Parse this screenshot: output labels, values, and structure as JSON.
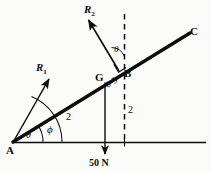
{
  "figure": {
    "background_color": "#fbfbfa",
    "ink_color": "#0d0d0d"
  },
  "points": {
    "a": {
      "label": "A",
      "x": 6,
      "y": 145
    },
    "b": {
      "label": "B",
      "x": 124,
      "y": 68
    },
    "c": {
      "label": "C",
      "x": 190,
      "y": 26
    },
    "g": {
      "label": "G",
      "x": 95,
      "y": 72
    }
  },
  "vectors": {
    "r1": {
      "label": "R",
      "subscript": "1",
      "x": 36,
      "y": 62
    },
    "r2": {
      "label": "R",
      "subscript": "2",
      "x": 84,
      "y": 4
    }
  },
  "angles": {
    "theta_at_a": {
      "label": "θ",
      "x": 26,
      "y": 130
    },
    "phi_at_a": {
      "label": "ϕ",
      "x": 47,
      "y": 124
    },
    "theta_at_b": {
      "label": "θ",
      "x": 114,
      "y": 45
    }
  },
  "dimensions": {
    "ag": {
      "label": "2",
      "x": 66,
      "y": 112
    },
    "gb": {
      "label": "0·5",
      "x": 104,
      "y": 82
    },
    "bc": {
      "label": "2",
      "x": 128,
      "y": 105
    }
  },
  "load": {
    "label": "50 N",
    "x": 89,
    "y": 158
  },
  "markers": {
    "right_angle_at_b": "right-angle-square"
  }
}
